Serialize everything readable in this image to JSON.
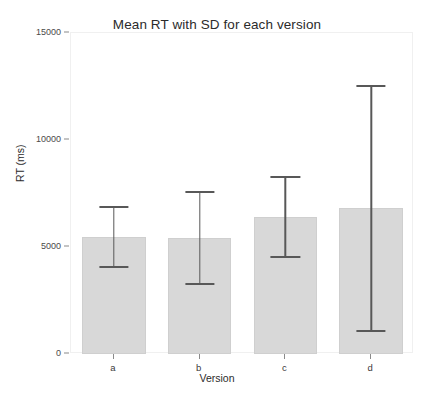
{
  "chart_data": {
    "type": "bar",
    "title": "Mean RT with SD for each version",
    "xlabel": "Version",
    "ylabel": "RT (ms)",
    "categories": [
      "a",
      "b",
      "c",
      "d"
    ],
    "values": [
      5470,
      5420,
      6400,
      6820
    ],
    "errors": [
      1400,
      2150,
      1870,
      5725
    ],
    "error_type": "SD",
    "upper_bounds": [
      6870,
      7570,
      8270,
      12545
    ],
    "lower_bounds": [
      4070,
      3270,
      4530,
      1095
    ],
    "ylim": [
      0,
      15000
    ],
    "yticks": [
      0,
      5000,
      10000,
      15000
    ],
    "ytick_labels": [
      "0",
      "5000",
      "10000",
      "15000"
    ],
    "grid": false,
    "legend": null,
    "bar_color": "#d8d8d8",
    "error_color": "#585858",
    "panel_background": "#ffffff"
  }
}
